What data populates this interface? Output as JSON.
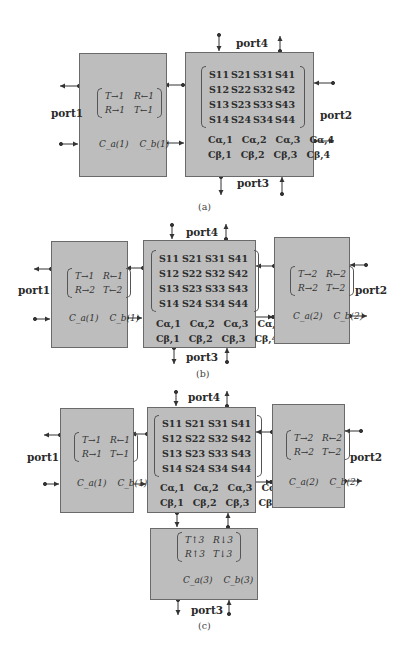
{
  "figure": {
    "panels": [
      {
        "id": "a",
        "caption": "(a)",
        "port_labels": {
          "port1": "port1",
          "port2": "port2",
          "port3": "port3",
          "port4": "port4"
        },
        "left_block": {
          "matrix": [
            [
              "T→1",
              "R←1"
            ],
            [
              "R→1",
              "T←1"
            ]
          ],
          "c_vectors": [
            "C_a(1)",
            "C_b(1)"
          ]
        },
        "scattering_block": {
          "s_matrix": [
            [
              "S11",
              "S21",
              "S31",
              "S41"
            ],
            [
              "S12",
              "S22",
              "S32",
              "S42"
            ],
            [
              "S13",
              "S23",
              "S33",
              "S43"
            ],
            [
              "S14",
              "S24",
              "S34",
              "S44"
            ]
          ],
          "c_alpha": [
            "Cα,1",
            "Cα,2",
            "Cα,3",
            "Cα,4"
          ],
          "c_beta": [
            "Cβ,1",
            "Cβ,2",
            "Cβ,3",
            "Cβ,4"
          ]
        }
      },
      {
        "id": "b",
        "caption": "(b)",
        "port_labels": {
          "port1": "port1",
          "port2": "port2",
          "port3": "port3",
          "port4": "port4"
        },
        "left_block": {
          "matrix": [
            [
              "T→1",
              "R←1"
            ],
            [
              "R→2",
              "T←2"
            ]
          ],
          "c_vectors": [
            "C_a(1)",
            "C_b(1)"
          ]
        },
        "scattering_block": {
          "s_matrix": [
            [
              "S11",
              "S21",
              "S31",
              "S41"
            ],
            [
              "S12",
              "S22",
              "S32",
              "S42"
            ],
            [
              "S13",
              "S23",
              "S33",
              "S43"
            ],
            [
              "S14",
              "S24",
              "S34",
              "S44"
            ]
          ],
          "c_alpha": [
            "Cα,1",
            "Cα,2",
            "Cα,3",
            "Cα,4"
          ],
          "c_beta": [
            "Cβ,1",
            "Cβ,2",
            "Cβ,3",
            "Cβ,4"
          ]
        },
        "right_block": {
          "matrix": [
            [
              "T→2",
              "R←2"
            ],
            [
              "R→2",
              "T←2"
            ]
          ],
          "c_vectors": [
            "C_a(2)",
            "C_b(2)"
          ]
        }
      },
      {
        "id": "c",
        "caption": "(c)",
        "port_labels": {
          "port1": "port1",
          "port2": "port2",
          "port3": "port3",
          "port4": "port4"
        },
        "left_block": {
          "matrix": [
            [
              "T→1",
              "R←1"
            ],
            [
              "R→1",
              "T←1"
            ]
          ],
          "c_vectors": [
            "C_a(1)",
            "C_b(1)"
          ]
        },
        "scattering_block": {
          "s_matrix": [
            [
              "S11",
              "S21",
              "S31",
              "S41"
            ],
            [
              "S12",
              "S22",
              "S32",
              "S42"
            ],
            [
              "S13",
              "S23",
              "S33",
              "S43"
            ],
            [
              "S14",
              "S24",
              "S34",
              "S44"
            ]
          ],
          "c_alpha": [
            "Cα,1",
            "Cα,2",
            "Cα,3",
            "Cα,4"
          ],
          "c_beta": [
            "Cβ,1",
            "Cβ,2",
            "Cβ,3",
            "Cβ,4"
          ]
        },
        "right_block": {
          "matrix": [
            [
              "T→2",
              "R←2"
            ],
            [
              "R→2",
              "T←2"
            ]
          ],
          "c_vectors": [
            "C_a(2)",
            "C_b(2)"
          ]
        },
        "bottom_block": {
          "matrix": [
            [
              "T↑3",
              "R↓3"
            ],
            [
              "R↑3",
              "T↓3"
            ]
          ],
          "c_vectors": [
            "C_a(3)",
            "C_b(3)"
          ]
        }
      }
    ]
  },
  "colors": {
    "block_fill": "#bdbdbd",
    "block_border": "#6a6a6a",
    "wire": "#333333"
  }
}
